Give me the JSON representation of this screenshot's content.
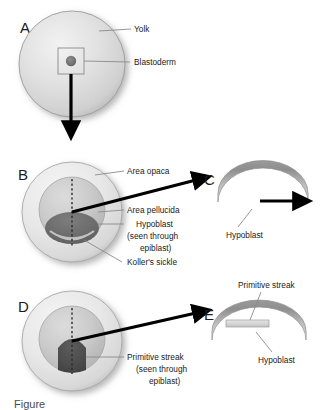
{
  "figure": {
    "caption_partial": "Figure",
    "panels": [
      {
        "letter": "A",
        "type": "yolk-sphere",
        "labels": [
          {
            "name": "yolk",
            "text": "Yolk"
          },
          {
            "name": "blastoderm",
            "text": "Blastoderm"
          }
        ]
      },
      {
        "letter": "B",
        "type": "blastoderm-surface-view",
        "labels": [
          {
            "name": "area-opaca",
            "text": "Area opaca"
          },
          {
            "name": "area-pellucida",
            "text": "Area pellucida"
          },
          {
            "name": "hypoblast",
            "text": "Hypoblast"
          },
          {
            "name": "hypoblast-sub-1",
            "text": "(seen through"
          },
          {
            "name": "hypoblast-sub-2",
            "text": "epiblast)"
          },
          {
            "name": "kollers-sickle",
            "text": "Koller's sickle"
          }
        ]
      },
      {
        "letter": "C",
        "type": "arch-section-hypoblast",
        "labels": [
          {
            "name": "hypoblast",
            "text": "Hypoblast"
          }
        ]
      },
      {
        "letter": "D",
        "type": "blastoderm-surface-view-streak",
        "labels": [
          {
            "name": "primitive-streak",
            "text": "Primitive streak"
          },
          {
            "name": "primitive-streak-sub-1",
            "text": "(seen through"
          },
          {
            "name": "primitive-streak-sub-2",
            "text": "epiblast)"
          }
        ]
      },
      {
        "letter": "E",
        "type": "arch-section-streak",
        "labels": [
          {
            "name": "primitive-streak",
            "text": "Primitive streak"
          },
          {
            "name": "hypoblast",
            "text": "Hypoblast"
          }
        ]
      }
    ]
  },
  "colors": {
    "yolk_light": "#e8e8e8",
    "yolk_mid": "#d4d4d4",
    "yolk_edge": "#9a9a9a",
    "area_opaca": "#e4e4e4",
    "area_pellucida": "#c9c9c9",
    "hypoblast_dark": "#6e6e6e",
    "kollers_sickle": "#b0b0b0",
    "streak_dark": "#4f4f4f",
    "arch_outer": "#8c8c8c",
    "arch_inner": "#cdcdcd",
    "arrow": "#000000",
    "leader": "#8a8a8a",
    "text": "#1a1a1a"
  }
}
